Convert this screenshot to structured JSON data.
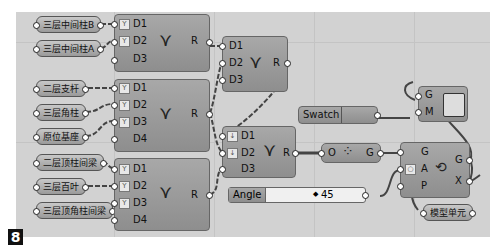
{
  "figure_number": "8",
  "params_left": [
    {
      "label": "三层中间柱B",
      "x": 36,
      "y": 16
    },
    {
      "label": "三层中间柱A",
      "x": 36,
      "y": 40
    },
    {
      "label": "二层支杆",
      "x": 36,
      "y": 80
    },
    {
      "label": "三层角柱",
      "x": 36,
      "y": 104
    },
    {
      "label": "原位基座",
      "x": 36,
      "y": 128
    },
    {
      "label": "二层顶柱间梁",
      "x": 36,
      "y": 154
    },
    {
      "label": "三层百叶",
      "x": 36,
      "y": 178
    },
    {
      "label": "三层顶角柱间梁",
      "x": 36,
      "y": 202
    }
  ],
  "merge_nodes": [
    {
      "id": "merge1",
      "ports": [
        "D1",
        "D2",
        "D3"
      ],
      "output": "R",
      "flat": [
        true,
        true,
        false
      ]
    },
    {
      "id": "merge2",
      "ports": [
        "D1",
        "D2",
        "D3",
        "D4"
      ],
      "output": "R",
      "flat": [
        true,
        true,
        true,
        false
      ]
    },
    {
      "id": "merge3",
      "ports": [
        "D1",
        "D2",
        "D3",
        "D4"
      ],
      "output": "R",
      "flat": [
        true,
        true,
        true,
        false
      ]
    },
    {
      "id": "merge4",
      "ports": [
        "D1",
        "D2",
        "D3"
      ],
      "output": "R",
      "flat": [
        false,
        false,
        false
      ]
    },
    {
      "id": "merge5",
      "ports": [
        "D1",
        "D2",
        "D3"
      ],
      "output": "R",
      "graft": [
        true,
        true,
        false
      ]
    }
  ],
  "group_node": {
    "input": "O",
    "output": "G"
  },
  "orient_node": {
    "inputs": [
      "G",
      "A",
      "P"
    ],
    "outputs": [
      "G",
      "X"
    ]
  },
  "preview_node": {
    "inputs": [
      "G",
      "M"
    ]
  },
  "swatch": {
    "label": "Swatch"
  },
  "slider": {
    "label": "Angle",
    "value": "45",
    "glyph": "◆"
  },
  "output_param": {
    "label": "模型单元"
  }
}
